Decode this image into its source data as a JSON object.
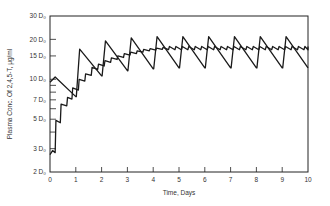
{
  "chart_data": {
    "type": "line",
    "title": "",
    "xlabel": "Time, Days",
    "ylabel": "Plasma Conc. Of 2,4,5-T, μg/ml",
    "xlim": [
      0,
      10
    ],
    "ylim_log": [
      2,
      30
    ],
    "yscale": "log",
    "y_unit": "D₀",
    "x_ticks": [
      "0",
      "1",
      "2",
      "3",
      "4",
      "5",
      "6",
      "7",
      "8",
      "9",
      "10"
    ],
    "y_ticks": [
      {
        "value": 2,
        "label": "2 D₀"
      },
      {
        "value": 3,
        "label": "3 D₀"
      },
      {
        "value": 5,
        "label": "5 D₀"
      },
      {
        "value": 7,
        "label": "7 D₀"
      },
      {
        "value": 10,
        "label": "10 D₀"
      },
      {
        "value": 15,
        "label": "15 D₀"
      },
      {
        "value": 20,
        "label": "20 D₀"
      },
      {
        "value": 30,
        "label": "30 D₀"
      }
    ],
    "y_minor_ticks": [
      4,
      6,
      8,
      9
    ],
    "grid": false,
    "legend": null,
    "series": [
      {
        "name": "Once-daily dosing (large dose)",
        "points": [
          [
            0,
            9.5
          ],
          [
            0.2,
            10.4
          ],
          [
            1.0,
            7.4
          ],
          [
            1.02,
            7.4
          ],
          [
            1.15,
            16.9
          ],
          [
            2.0,
            10.6
          ],
          [
            2.02,
            10.6
          ],
          [
            2.15,
            19.5
          ],
          [
            3.0,
            11.6
          ],
          [
            3.02,
            11.6
          ],
          [
            3.15,
            20.5
          ],
          [
            4.0,
            12.0
          ],
          [
            4.02,
            12.0
          ],
          [
            4.15,
            21.0
          ],
          [
            5.0,
            12.2
          ],
          [
            5.02,
            12.2
          ],
          [
            5.15,
            21.0
          ],
          [
            6.0,
            12.2
          ],
          [
            6.02,
            12.2
          ],
          [
            6.15,
            21.0
          ],
          [
            7.0,
            12.2
          ],
          [
            7.02,
            12.2
          ],
          [
            7.15,
            21.0
          ],
          [
            8.0,
            12.2
          ],
          [
            8.02,
            12.2
          ],
          [
            8.15,
            21.0
          ],
          [
            9.0,
            12.2
          ],
          [
            9.02,
            12.2
          ],
          [
            9.15,
            21.0
          ],
          [
            10.0,
            12.2
          ]
        ]
      },
      {
        "name": "Frequent dosing (small doses)",
        "points": [
          [
            0,
            2.7
          ],
          [
            0.1,
            2.9
          ],
          [
            0.2,
            2.8
          ],
          [
            0.23,
            4.9
          ],
          [
            0.4,
            4.7
          ],
          [
            0.43,
            6.5
          ],
          [
            0.65,
            6.3
          ],
          [
            0.68,
            7.3
          ],
          [
            0.85,
            7.1
          ],
          [
            0.88,
            8.6
          ],
          [
            1.1,
            8.3
          ],
          [
            1.13,
            10.0
          ],
          [
            1.35,
            9.7
          ],
          [
            1.38,
            11.0
          ],
          [
            1.6,
            10.7
          ],
          [
            1.63,
            12.3
          ],
          [
            1.85,
            11.9
          ],
          [
            1.88,
            13.0
          ],
          [
            2.1,
            12.6
          ],
          [
            2.13,
            13.8
          ],
          [
            2.35,
            13.4
          ],
          [
            2.38,
            14.5
          ],
          [
            2.6,
            14.1
          ],
          [
            2.63,
            15.0
          ],
          [
            2.85,
            14.6
          ],
          [
            2.88,
            15.6
          ],
          [
            3.1,
            15.2
          ],
          [
            3.13,
            16.0
          ],
          [
            3.35,
            15.6
          ],
          [
            3.38,
            16.4
          ],
          [
            3.6,
            16.0
          ],
          [
            3.63,
            16.8
          ],
          [
            3.85,
            16.4
          ],
          [
            3.88,
            17.0
          ],
          [
            4.1,
            16.6
          ],
          [
            4.13,
            17.2
          ],
          [
            4.35,
            16.8
          ],
          [
            4.38,
            17.4
          ],
          [
            10.0,
            17.5
          ]
        ],
        "steady_state_mean": 17.5,
        "ripple": true
      }
    ]
  },
  "axes": {
    "x_title": "Time, Days",
    "y_title": "Plasma Conc. Of 2,4,5-T, μg/ml"
  }
}
